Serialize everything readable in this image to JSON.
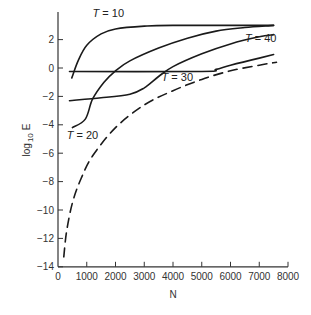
{
  "chart_data": {
    "type": "line",
    "title": "",
    "xlabel": "N",
    "ylabel": "log 10 E",
    "ylabel_main": "log",
    "ylabel_sub": "10",
    "ylabel_tail": "E",
    "xlim": [
      0,
      8000
    ],
    "ylim": [
      -14,
      4
    ],
    "grid": false,
    "legend": "none (inline curve annotations)",
    "x_ticks": [
      0,
      1000,
      2000,
      3000,
      4000,
      5000,
      6000,
      7000,
      8000
    ],
    "x_tick_labels": [
      "0",
      "1000",
      "2000",
      "3000",
      "4000",
      "5000",
      "6000",
      "7000",
      "8000"
    ],
    "y_ticks": [
      2,
      0,
      -2,
      -4,
      -6,
      -8,
      -10,
      -12,
      -14
    ],
    "y_tick_labels": [
      "2",
      "0",
      "−2",
      "−4",
      "−6",
      "−8",
      "−10",
      "−12",
      "−14"
    ],
    "series": [
      {
        "name": "T = 10",
        "style": "solid",
        "points": [
          [
            480,
            -0.7
          ],
          [
            700,
            0.5
          ],
          [
            1000,
            1.6
          ],
          [
            1500,
            2.4
          ],
          [
            2000,
            2.75
          ],
          [
            3000,
            2.95
          ],
          [
            4000,
            3.0
          ],
          [
            7500,
            3.0
          ]
        ]
      },
      {
        "name": "T = 20",
        "style": "solid",
        "points": [
          [
            500,
            -4.2
          ],
          [
            950,
            -3.6
          ],
          [
            1200,
            -2.2
          ],
          [
            1600,
            -1.0
          ],
          [
            2000,
            -0.2
          ],
          [
            2500,
            0.5
          ],
          [
            3500,
            1.4
          ],
          [
            4500,
            2.1
          ],
          [
            5500,
            2.6
          ],
          [
            6500,
            2.85
          ],
          [
            7500,
            3.0
          ]
        ]
      },
      {
        "name": "T = 30",
        "style": "solid",
        "points": [
          [
            400,
            -2.3
          ],
          [
            1500,
            -2.1
          ],
          [
            2500,
            -1.85
          ],
          [
            3000,
            -1.4
          ],
          [
            3500,
            -0.6
          ],
          [
            4000,
            0.1
          ],
          [
            5000,
            1.0
          ],
          [
            6000,
            1.7
          ],
          [
            7000,
            2.2
          ],
          [
            7500,
            2.35
          ]
        ]
      },
      {
        "name": "T = 40",
        "style": "solid",
        "points": [
          [
            400,
            -0.25
          ],
          [
            5000,
            -0.25
          ],
          [
            5500,
            -0.1
          ],
          [
            6000,
            0.2
          ],
          [
            7000,
            0.7
          ],
          [
            7500,
            0.95
          ]
        ]
      },
      {
        "name": "bound",
        "style": "dashed",
        "points": [
          [
            200,
            -13.3
          ],
          [
            300,
            -11.5
          ],
          [
            500,
            -9.5
          ],
          [
            800,
            -7.8
          ],
          [
            1200,
            -6.2
          ],
          [
            2000,
            -4.2
          ],
          [
            3000,
            -2.6
          ],
          [
            4000,
            -1.6
          ],
          [
            5000,
            -0.8
          ],
          [
            6000,
            -0.2
          ],
          [
            7000,
            0.2
          ],
          [
            7600,
            0.4
          ]
        ]
      }
    ],
    "annotations": [
      {
        "label_var": "T",
        "label_rest": " = 10",
        "x": 1200,
        "y": 3.6
      },
      {
        "label_var": "T",
        "label_rest": " = 20",
        "x": 300,
        "y": -5.0
      },
      {
        "label_var": "T",
        "label_rest": " = 30",
        "x": 3600,
        "y": -0.9
      },
      {
        "label_var": "T",
        "label_rest": " = 40",
        "x": 6500,
        "y": 1.8
      }
    ]
  }
}
